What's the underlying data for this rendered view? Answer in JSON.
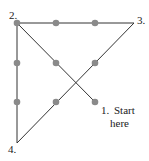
{
  "diagram": {
    "dots": [
      {
        "x": 17,
        "y": 23
      },
      {
        "x": 56,
        "y": 23
      },
      {
        "x": 95,
        "y": 23
      },
      {
        "x": 17,
        "y": 63
      },
      {
        "x": 56,
        "y": 63
      },
      {
        "x": 95,
        "y": 63
      },
      {
        "x": 17,
        "y": 102
      },
      {
        "x": 56,
        "y": 102
      },
      {
        "x": 95,
        "y": 102
      }
    ],
    "path_points": [
      {
        "label": "1.",
        "x": 95,
        "y": 102
      },
      {
        "label": "2.",
        "x": 17,
        "y": 23
      },
      {
        "label": "3.",
        "x": 134,
        "y": 23
      },
      {
        "label": "4.",
        "x": 17,
        "y": 143
      }
    ],
    "labels": {
      "p1": "1.",
      "p1_text_line1": "Start",
      "p1_text_line2": "here",
      "p2": "2.",
      "p3": "3.",
      "p4": "4."
    },
    "colors": {
      "line": "#333333",
      "dot": "#8a8a8a"
    }
  }
}
